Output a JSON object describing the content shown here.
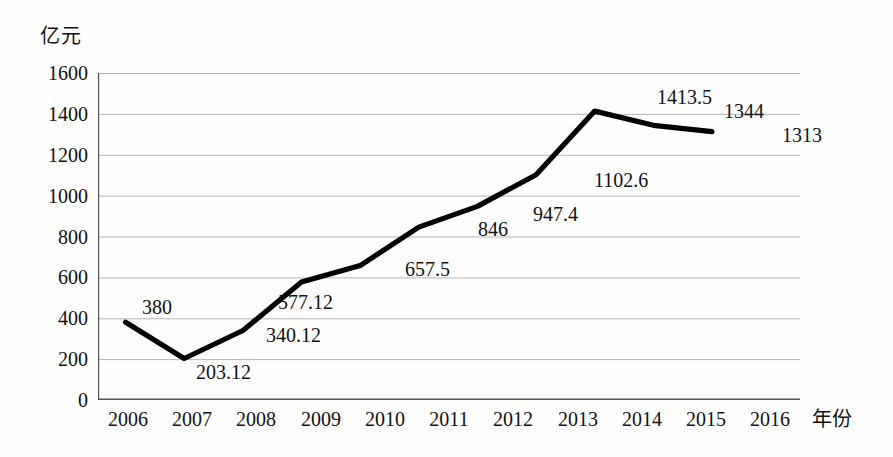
{
  "chart_data": {
    "type": "line",
    "title": "",
    "unit_label": "亿元",
    "xlabel": "年份",
    "ylabel": "",
    "categories": [
      "2006",
      "2007",
      "2008",
      "2009",
      "2010",
      "2011",
      "2012",
      "2013",
      "2014",
      "2015",
      "2016"
    ],
    "values": [
      380,
      203.12,
      340.12,
      577.12,
      657.5,
      846,
      947.4,
      1102.6,
      1413.5,
      1344,
      1313
    ],
    "point_labels": [
      "380",
      "203.12",
      "340.12",
      "577.12",
      "657.5",
      "846",
      "947.4",
      "1102.6",
      "1413.5",
      "1344",
      "1313"
    ],
    "ylim": [
      0,
      1600
    ],
    "ytick_values": [
      0,
      200,
      400,
      600,
      800,
      1000,
      1200,
      1400,
      1600
    ],
    "yticks": [
      "0",
      "200",
      "400",
      "600",
      "800",
      "1000",
      "1200",
      "1400",
      "1600"
    ],
    "grid": true,
    "legend": false,
    "series_color": "#000000",
    "grid_color": "#b5b5b5",
    "axis_color": "#555555"
  },
  "labels": {
    "unit": "亿元",
    "xaxis_title": "年份",
    "y0": "0",
    "y200": "200",
    "y400": "400",
    "y600": "600",
    "y800": "800",
    "y1000": "1000",
    "y1200": "1200",
    "y1400": "1400",
    "y1600": "1600",
    "x2006": "2006",
    "x2007": "2007",
    "x2008": "2008",
    "x2009": "2009",
    "x2010": "2010",
    "x2011": "2011",
    "x2012": "2012",
    "x2013": "2013",
    "x2014": "2014",
    "x2015": "2015",
    "x2016": "2016",
    "d2006": "380",
    "d2007": "203.12",
    "d2008": "340.12",
    "d2009": "577.12",
    "d2010": "657.5",
    "d2011": "846",
    "d2012": "947.4",
    "d2013": "1102.6",
    "d2014": "1413.5",
    "d2015": "1344",
    "d2016": "1313"
  }
}
